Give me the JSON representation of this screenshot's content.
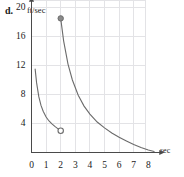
{
  "figure": {
    "part_label": "d.",
    "y_axis_title": "ft/sec",
    "x_axis_title": "sec"
  },
  "chart_data": {
    "type": "line",
    "title": "",
    "xlabel": "sec",
    "ylabel": "ft/sec",
    "xlim": [
      0,
      8.6
    ],
    "ylim": [
      0,
      21
    ],
    "grid": true,
    "legend": false,
    "xticks": [
      "0",
      "1",
      "2",
      "3",
      "4",
      "5",
      "6",
      "7",
      "8"
    ],
    "xtick_values": [
      0,
      1,
      2,
      3,
      4,
      5,
      6,
      7,
      8
    ],
    "yticks": [
      "4",
      "8",
      "12",
      "16",
      "20"
    ],
    "ytick_values": [
      4,
      8,
      12,
      16,
      20
    ],
    "series": [
      {
        "name": "branch-1",
        "domain": [
          0.25,
          2
        ],
        "x": [
          0.25,
          0.35,
          0.5,
          0.65,
          0.8,
          1.0,
          1.2,
          1.4,
          1.6,
          1.8,
          2.0
        ],
        "values": [
          11.5,
          9.6,
          7.7,
          6.5,
          5.7,
          4.9,
          4.35,
          3.95,
          3.6,
          3.3,
          3.0
        ]
      },
      {
        "name": "branch-2",
        "domain": [
          2,
          8.4
        ],
        "x": [
          2.0,
          2.2,
          2.5,
          2.8,
          3.2,
          3.6,
          4.0,
          4.5,
          5.0,
          5.5,
          6.0,
          6.5,
          7.0,
          7.5,
          8.0,
          8.4
        ],
        "values": [
          18.5,
          15.4,
          12.2,
          10.0,
          7.9,
          6.4,
          5.3,
          4.2,
          3.4,
          2.7,
          2.1,
          1.6,
          1.1,
          0.7,
          0.35,
          0.15
        ]
      }
    ],
    "markers": [
      {
        "name": "closed-point",
        "x": 2,
        "y": 18.5,
        "style": "filled"
      },
      {
        "name": "open-point",
        "x": 2,
        "y": 3.0,
        "style": "open"
      }
    ],
    "colors": {
      "curve": "#6b6b6b",
      "grid": "#e3e3e6",
      "axis": "#4a4a4a",
      "marker_fill": "#8a8a8a",
      "text": "#1a1a1a"
    }
  }
}
